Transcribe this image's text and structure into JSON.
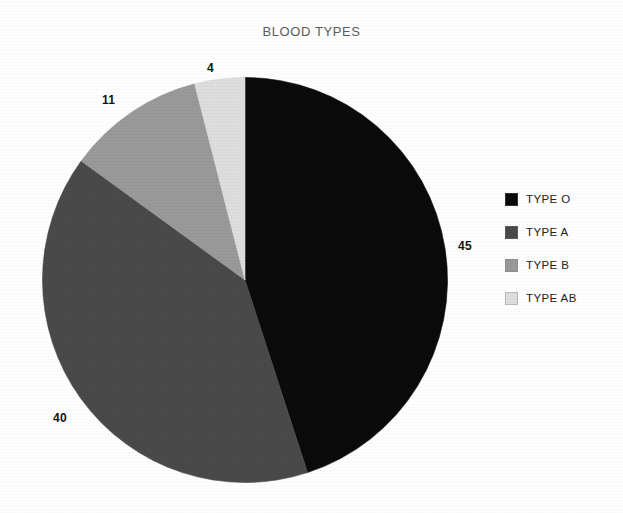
{
  "chart_data": {
    "type": "pie",
    "title": "BLOOD TYPES",
    "xlabel": "",
    "ylabel": "",
    "legend_position": "right",
    "grid": false,
    "start_angle_deg": 0,
    "direction": "clockwise",
    "categories": [
      "TYPE O",
      "TYPE A",
      "TYPE B",
      "TYPE AB"
    ],
    "values": [
      45,
      40,
      11,
      4
    ],
    "value_labels": [
      "45",
      "40",
      "11",
      "4"
    ],
    "colors": [
      "#0b0b0b",
      "#4a4a4a",
      "#9a9a9a",
      "#dedede"
    ],
    "slices": [
      {
        "label": "TYPE O",
        "value": 45,
        "value_label": "45",
        "color": "#0b0b0b"
      },
      {
        "label": "TYPE A",
        "value": 40,
        "value_label": "40",
        "color": "#4a4a4a"
      },
      {
        "label": "TYPE B",
        "value": 11,
        "value_label": "11",
        "color": "#9a9a9a"
      },
      {
        "label": "TYPE AB",
        "value": 4,
        "value_label": "4",
        "color": "#dedede"
      }
    ]
  },
  "legend": {
    "items": [
      {
        "label": "TYPE O",
        "swatch_name": "legend-swatch-type-o",
        "color": "#0b0b0b"
      },
      {
        "label": "TYPE A",
        "swatch_name": "legend-swatch-type-a",
        "color": "#4a4a4a"
      },
      {
        "label": "TYPE B",
        "swatch_name": "legend-swatch-type-b",
        "color": "#9a9a9a"
      },
      {
        "label": "TYPE AB",
        "swatch_name": "legend-swatch-type-ab",
        "color": "#dedede"
      }
    ]
  }
}
